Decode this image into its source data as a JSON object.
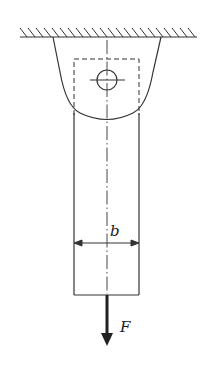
{
  "diagram": {
    "labels": {
      "width": "b",
      "force": "F"
    },
    "colors": {
      "stroke": "#333333",
      "background": "#ffffff"
    },
    "elements": [
      "ceiling-support-hatched",
      "bracket-clevis",
      "pin-hole",
      "dashed-inner-outline",
      "center-line",
      "bar",
      "width-dimension",
      "force-arrow"
    ]
  }
}
